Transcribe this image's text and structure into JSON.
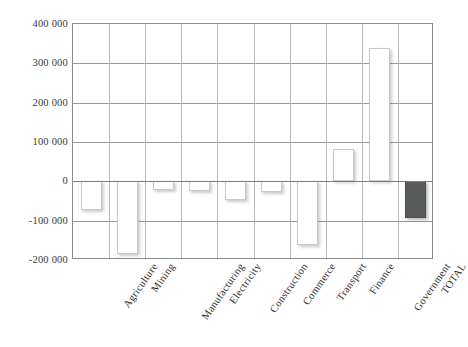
{
  "chart_data": {
    "type": "bar",
    "title": "",
    "subtitle": "",
    "xlabel": "",
    "ylabel": "",
    "categories": [
      "Agriculture",
      "Mining",
      "Manufacturing",
      "Electricity",
      "Construction",
      "Commerce",
      "Transport",
      "Finance",
      "Government",
      "TOTAL"
    ],
    "values": [
      -73000,
      -185000,
      -23000,
      -25000,
      -48000,
      -28000,
      -162000,
      81000,
      338000,
      -94000
    ],
    "series": [
      {
        "name": "Sector value",
        "values": [
          -73000,
          -185000,
          -23000,
          -25000,
          -48000,
          -28000,
          -162000,
          81000,
          338000,
          -94000
        ]
      }
    ],
    "ylim": [
      -200000,
      400000
    ],
    "yticks": [
      400000,
      300000,
      200000,
      100000,
      0,
      -100000,
      -200000
    ],
    "ytick_labels": [
      "400 000",
      "300 000",
      "200 000",
      "100 000",
      "0",
      "-100 000",
      "-200 000"
    ],
    "grid": true,
    "legend": "none",
    "bar_colors": {
      "default": "#ffffff",
      "default_border": "#c8c8c8",
      "total": "#585c5a",
      "total_border": "#4a4e4c"
    },
    "axis_color": "#8d8d8d",
    "gridline_color": "#9a9a9a"
  }
}
